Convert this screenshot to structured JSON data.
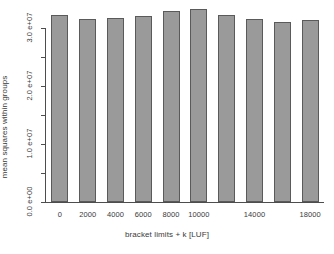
{
  "chart_data": {
    "type": "bar",
    "title": "",
    "xlabel": "bracket limits + k [LUF]",
    "ylabel": "mean squares within groups",
    "categories": [
      "0",
      "2000",
      "4000",
      "6000",
      "8000",
      "10000",
      "12000",
      "14000",
      "16000",
      "18000"
    ],
    "values": [
      32300000,
      31500000,
      31800000,
      32100000,
      32900000,
      33200000,
      32200000,
      31600000,
      31000000,
      31300000
    ],
    "ylim": [
      0,
      34500000
    ],
    "yticks": [
      0,
      5000000,
      10000000,
      15000000,
      20000000,
      25000000,
      30000000
    ],
    "ytick_labels": [
      "0.0 e+00",
      "",
      "1.0 e+07",
      "",
      "2.0 e+07",
      "",
      "3.0 e+07"
    ],
    "xtick_labels": [
      "0",
      "2000",
      "4000",
      "6000",
      "8000",
      "10000",
      "",
      "14000",
      "",
      "18000"
    ],
    "grid": false,
    "legend": false,
    "bar_color": "#9a9a9a",
    "bar_border_color": "#5a5a5a",
    "axis_color": "#4d4d4d"
  }
}
